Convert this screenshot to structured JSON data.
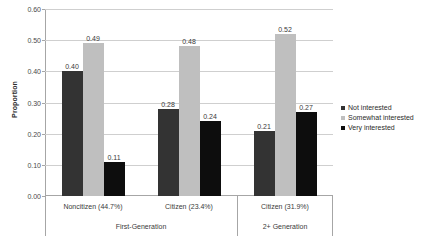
{
  "chart_data": {
    "type": "bar",
    "title": "",
    "xlabel": "",
    "ylabel": "Proportion",
    "ylim": [
      0.0,
      0.6
    ],
    "yticks": [
      "0.00",
      "0.10",
      "0.20",
      "0.30",
      "0.40",
      "0.50",
      "0.60"
    ],
    "ytick_values": [
      0.0,
      0.1,
      0.2,
      0.3,
      0.4,
      0.5,
      0.6
    ],
    "grid": true,
    "legend_position": "right",
    "categories": [
      "Noncitizen (44.7%)",
      "Citizen (23.4%)",
      "Citizen (31.9%)"
    ],
    "group_labels": [
      "First-Generation",
      "2+ Generation"
    ],
    "group_spans": [
      2,
      1
    ],
    "series": [
      {
        "name": "Not interested",
        "color": "#333333",
        "values": [
          0.4,
          0.28,
          0.21
        ],
        "labels": [
          "0.40",
          "0.28",
          "0.21"
        ]
      },
      {
        "name": "Somewhat interested",
        "color": "#bfbfbf",
        "values": [
          0.49,
          0.48,
          0.52
        ],
        "labels": [
          "0.49",
          "0.48",
          "0.52"
        ]
      },
      {
        "name": "Very interested",
        "color": "#0d0d0d",
        "values": [
          0.11,
          0.24,
          0.27
        ],
        "labels": [
          "0.11",
          "0.24",
          "0.27"
        ]
      }
    ]
  }
}
